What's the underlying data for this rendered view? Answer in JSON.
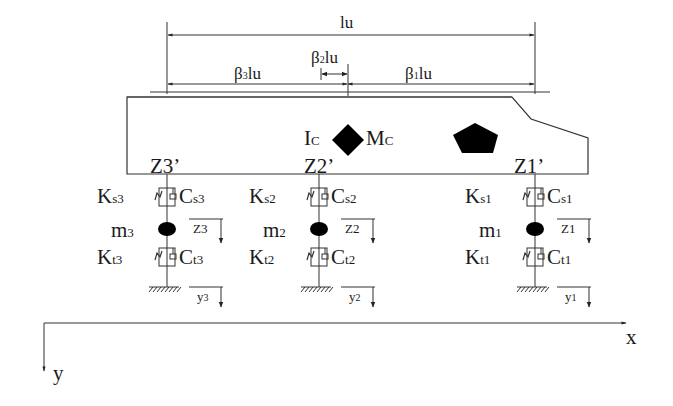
{
  "diagram": {
    "type": "vehicle vertical dynamics model (three-axle half-car)",
    "dimensions": {
      "total": "lu",
      "beta3": {
        "sym": "β",
        "sub": "3",
        "rest": "lu"
      },
      "beta2": {
        "sym": "β",
        "sub": "2",
        "rest": "lu"
      },
      "beta1": {
        "sym": "β",
        "sub": "1",
        "rest": "lu"
      }
    },
    "body": {
      "inertia": {
        "main": "I",
        "sub": "C"
      },
      "mass": {
        "main": "M",
        "sub": "C"
      },
      "cg_marker": "diamond",
      "other_marker": "pentagon"
    },
    "axles": [
      {
        "id": "3",
        "z_prime": "Z3’",
        "ks": {
          "main": "K",
          "sub": "s3"
        },
        "cs": {
          "main": "C",
          "sub": "s3"
        },
        "m": {
          "main": "m",
          "sub": "3"
        },
        "z": "Z3",
        "kt": {
          "main": "K",
          "sub": "t3"
        },
        "ct": {
          "main": "C",
          "sub": "t3"
        },
        "y": {
          "main": "y",
          "sub": "3"
        }
      },
      {
        "id": "2",
        "z_prime": "Z2’",
        "ks": {
          "main": "K",
          "sub": "s2"
        },
        "cs": {
          "main": "C",
          "sub": "s2"
        },
        "m": {
          "main": "m",
          "sub": "2"
        },
        "z": "Z2",
        "kt": {
          "main": "K",
          "sub": "t2"
        },
        "ct": {
          "main": "C",
          "sub": "t2"
        },
        "y": {
          "main": "y",
          "sub": "2"
        }
      },
      {
        "id": "1",
        "z_prime": "Z1’",
        "ks": {
          "main": "K",
          "sub": "s1"
        },
        "cs": {
          "main": "C",
          "sub": "s1"
        },
        "m": {
          "main": "m",
          "sub": "1"
        },
        "z": "Z1",
        "kt": {
          "main": "K",
          "sub": "t1"
        },
        "ct": {
          "main": "C",
          "sub": "t1"
        },
        "y": {
          "main": "y",
          "sub": "1"
        }
      }
    ],
    "axes": {
      "x_label": "x",
      "y_label": "y"
    },
    "colors": {
      "line": "#333333",
      "fill": "#000000",
      "background": "#ffffff"
    }
  }
}
